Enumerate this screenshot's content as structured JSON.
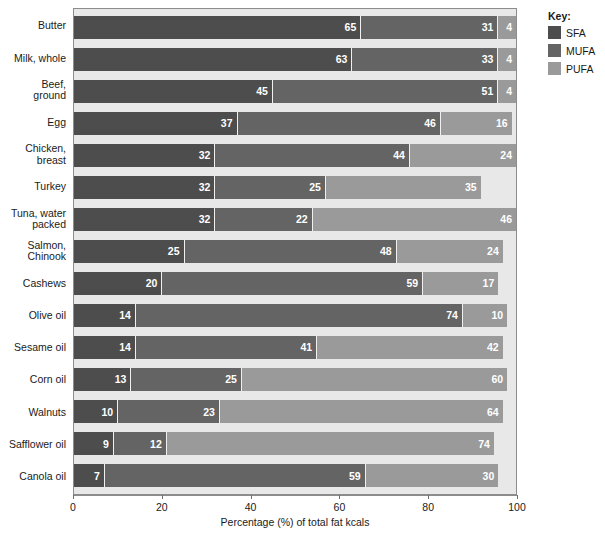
{
  "chart_data": {
    "type": "bar",
    "subtype": "stacked-horizontal-100percent",
    "title": "",
    "xlabel": "Percentage (%) of total fat kcals",
    "ylabel": "",
    "xlim": [
      0,
      100
    ],
    "xticks": [
      "0",
      "20",
      "40",
      "60",
      "80",
      "100"
    ],
    "grid": false,
    "legend_position": "right",
    "legend_title": "Key:",
    "categories": [
      "Butter",
      "Milk, whole",
      "Beef,\nground",
      "Egg",
      "Chicken,\nbreast",
      "Turkey",
      "Tuna, water\npacked",
      "Salmon,\nChinook",
      "Cashews",
      "Olive oil",
      "Sesame oil",
      "Corn oil",
      "Walnuts",
      "Safflower oil",
      "Canola oil"
    ],
    "series": [
      {
        "name": "SFA",
        "color": "#4d4d4d",
        "values": [
          65,
          63,
          45,
          37,
          32,
          32,
          32,
          25,
          20,
          14,
          14,
          13,
          10,
          9,
          7
        ]
      },
      {
        "name": "MUFA",
        "color": "#646464",
        "values": [
          31,
          33,
          51,
          46,
          44,
          25,
          22,
          48,
          59,
          74,
          41,
          25,
          23,
          12,
          59
        ]
      },
      {
        "name": "PUFA",
        "color": "#9a9a9a",
        "values": [
          4,
          4,
          4,
          16,
          24,
          35,
          46,
          24,
          17,
          10,
          42,
          60,
          64,
          74,
          30
        ]
      }
    ]
  },
  "colors": {
    "sfa": "#4d4d4d",
    "mufa": "#646464",
    "pufa": "#9a9a9a",
    "plot_background": "#e8e8e8",
    "axis": "#8c8c8c"
  }
}
